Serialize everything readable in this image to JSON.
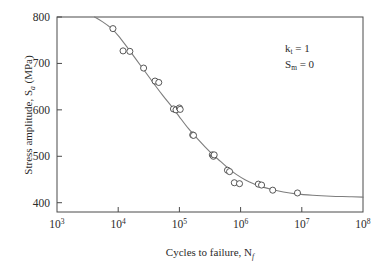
{
  "chart_data": {
    "type": "scatter",
    "title": "",
    "xlabel": "Cycles to failure, N",
    "xlabel_sub": "f",
    "ylabel": "Stress amplitude, S",
    "ylabel_sub": "a",
    "ylabel_unit": " (MPa)",
    "xscale": "log",
    "yscale": "linear",
    "xlim": [
      1000,
      100000000
    ],
    "ylim": [
      380,
      800
    ],
    "grid": false,
    "legend": false,
    "x_ticks": [
      {
        "value": 1000,
        "mantissa": "10",
        "exponent": "3"
      },
      {
        "value": 10000,
        "mantissa": "10",
        "exponent": "4"
      },
      {
        "value": 100000,
        "mantissa": "10",
        "exponent": "5"
      },
      {
        "value": 1000000,
        "mantissa": "10",
        "exponent": "6"
      },
      {
        "value": 10000000,
        "mantissa": "10",
        "exponent": "7"
      },
      {
        "value": 100000000,
        "mantissa": "10",
        "exponent": "8"
      }
    ],
    "y_ticks": [
      {
        "value": 400,
        "label": "400"
      },
      {
        "value": 500,
        "label": "500"
      },
      {
        "value": 600,
        "label": "600"
      },
      {
        "value": 700,
        "label": "700"
      },
      {
        "value": 800,
        "label": "800"
      }
    ],
    "annotations": [
      {
        "name": "stress-concentration-factor",
        "symbol": "k",
        "sub": "t",
        "rest": " = 1"
      },
      {
        "name": "mean-stress",
        "symbol": "S",
        "sub": "m",
        "rest": " = 0"
      }
    ],
    "series": [
      {
        "name": "Fatigue test data",
        "marker": "open-circle",
        "points": [
          [
            8200,
            775
          ],
          [
            12000,
            727
          ],
          [
            15500,
            726
          ],
          [
            26000,
            690
          ],
          [
            40000,
            662
          ],
          [
            46000,
            659
          ],
          [
            80000,
            602
          ],
          [
            88000,
            600
          ],
          [
            100000,
            604
          ],
          [
            103000,
            601
          ],
          [
            165000,
            546
          ],
          [
            170000,
            545
          ],
          [
            345000,
            503
          ],
          [
            360000,
            500
          ],
          [
            370000,
            503
          ],
          [
            610000,
            470
          ],
          [
            660000,
            467
          ],
          [
            790000,
            443
          ],
          [
            960000,
            441
          ],
          [
            1950000,
            440
          ],
          [
            2200000,
            438
          ],
          [
            3350000,
            427
          ],
          [
            8500000,
            421
          ]
        ]
      }
    ],
    "fit_curve": {
      "name": "S-N curve fit",
      "color": "#7d7d7d",
      "points": [
        [
          4100,
          800
        ],
        [
          5500,
          790
        ],
        [
          7500,
          777
        ],
        [
          10000,
          760
        ],
        [
          14000,
          735
        ],
        [
          20000,
          707
        ],
        [
          28000,
          681
        ],
        [
          40000,
          653
        ],
        [
          55000,
          629
        ],
        [
          75000,
          607
        ],
        [
          100000,
          585
        ],
        [
          140000,
          560
        ],
        [
          190000,
          540
        ],
        [
          260000,
          521
        ],
        [
          350000,
          504
        ],
        [
          470000,
          489
        ],
        [
          630000,
          474
        ],
        [
          850000,
          461
        ],
        [
          1200000,
          449
        ],
        [
          1700000,
          440
        ],
        [
          2400000,
          433
        ],
        [
          3400000,
          428
        ],
        [
          5000000,
          423
        ],
        [
          8000000,
          419
        ],
        [
          15000000,
          416
        ],
        [
          30000000,
          414
        ],
        [
          60000000,
          413
        ],
        [
          100000000,
          412
        ]
      ]
    }
  },
  "geometry": {
    "plot_left": 57,
    "plot_right": 363,
    "plot_top": 17,
    "plot_bottom": 212
  }
}
